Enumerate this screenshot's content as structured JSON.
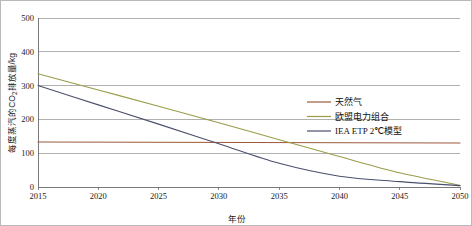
{
  "chart_data": {
    "type": "line",
    "title": "",
    "xlabel": "年份",
    "ylabel": "每度蒸汽的CO2排放量/kg",
    "ylabel_parts": {
      "pre": "每度蒸汽的CO",
      "sub": "2",
      "post": "排放量/kg"
    },
    "x": [
      2015,
      2020,
      2025,
      2030,
      2035,
      2040,
      2045,
      2050
    ],
    "xlim": [
      2015,
      2050
    ],
    "ylim": [
      0,
      500
    ],
    "xticks": [
      "2015",
      "2020",
      "2025",
      "2030",
      "2035",
      "2040",
      "2045",
      "2050"
    ],
    "yticks": [
      "0",
      "100",
      "200",
      "300",
      "400",
      "500"
    ],
    "ytick_values": [
      0,
      100,
      200,
      300,
      400,
      500
    ],
    "grid": true,
    "grid_axis": "y",
    "legend_position": "center-right",
    "series": [
      {
        "name": "天然气",
        "color": "#9c5a3c",
        "x": [
          2015,
          2050
        ],
        "values": [
          133,
          130
        ]
      },
      {
        "name": "欧盟电力组合",
        "color": "#9a9c4a",
        "x": [
          2015,
          2020,
          2025,
          2030,
          2035,
          2040,
          2045,
          2050
        ],
        "values": [
          335,
          287,
          239,
          190,
          140,
          90,
          42,
          5
        ]
      },
      {
        "name": "IEA ETP 2℃模型",
        "color": "#4a4f6e",
        "x": [
          2015,
          2020,
          2025,
          2030,
          2035,
          2040,
          2045,
          2050
        ],
        "values": [
          300,
          243,
          186,
          128,
          70,
          32,
          16,
          4
        ]
      }
    ]
  },
  "legend": {
    "items": [
      {
        "label": "天然气",
        "color": "#9c5a3c"
      },
      {
        "label": "欧盟电力组合",
        "color": "#9a9c4a"
      },
      {
        "label": "IEA ETP 2℃模型",
        "color": "#4a4f6e"
      }
    ]
  }
}
